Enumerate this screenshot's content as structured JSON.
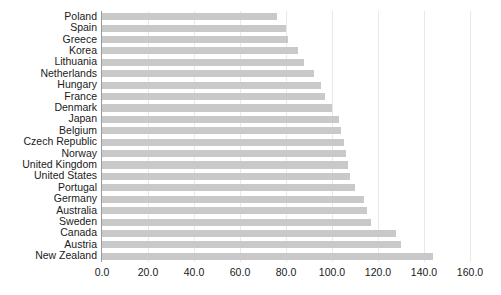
{
  "chart": {
    "title": "",
    "subtitle": "",
    "xlabel": "",
    "ylabel": "",
    "bar_color": "#c9c9c9",
    "grid_color": "#e9e9e9",
    "axis_color": "#9a9a9a",
    "text_color": "#1a1a1a"
  },
  "chart_data": {
    "type": "bar",
    "orientation": "horizontal",
    "title": "",
    "xlabel": "",
    "ylabel": "",
    "xlim": [
      0.0,
      160.0
    ],
    "xticks": [
      "0.0",
      "20.0",
      "40.0",
      "60.0",
      "80.0",
      "100.0",
      "120.0",
      "140.0",
      "160.0"
    ],
    "xtick_values": [
      0.0,
      20.0,
      40.0,
      60.0,
      80.0,
      100.0,
      120.0,
      140.0,
      160.0
    ],
    "grid": true,
    "legend": false,
    "categories": [
      "Poland",
      "Spain",
      "Greece",
      "Korea",
      "Lithuania",
      "Netherlands",
      "Hungary",
      "France",
      "Denmark",
      "Japan",
      "Belgium",
      "Czech Republic",
      "Norway",
      "United Kingdom",
      "United States",
      "Portugal",
      "Germany",
      "Australia",
      "Sweden",
      "Canada",
      "Austria",
      "New Zealand"
    ],
    "values": [
      76.0,
      80.0,
      81.0,
      85.0,
      88.0,
      92.0,
      95.0,
      97.0,
      100.0,
      103.0,
      104.0,
      105.0,
      106.0,
      107.0,
      108.0,
      110.0,
      114.0,
      115.0,
      117.0,
      128.0,
      130.0,
      144.0
    ]
  }
}
